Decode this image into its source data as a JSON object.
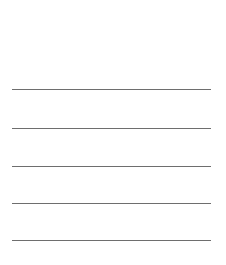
{
  "page": {
    "background_color": "#ffffff",
    "width": 226,
    "height": 265
  },
  "rules": {
    "count": 5,
    "color": "#6e6e6e",
    "thickness_px": 1,
    "left_px": 12,
    "right_px": 211,
    "length_px": 199,
    "orientation": "horizontal",
    "spacing_px": 38,
    "items": [
      {
        "index": "1",
        "y_px": 89,
        "label": ""
      },
      {
        "index": "2",
        "y_px": 128,
        "label": ""
      },
      {
        "index": "3",
        "y_px": 166,
        "label": ""
      },
      {
        "index": "4",
        "y_px": 203,
        "label": ""
      },
      {
        "index": "5",
        "y_px": 240,
        "label": ""
      }
    ]
  },
  "margins": {
    "top_px": 88,
    "bottom_px": 23
  }
}
